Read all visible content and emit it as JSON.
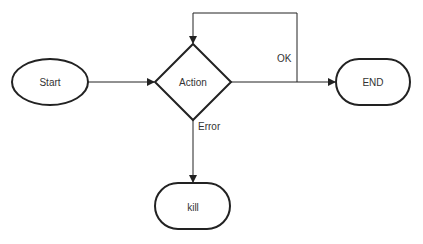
{
  "diagram": {
    "type": "flowchart",
    "nodes": [
      {
        "id": "start",
        "label": "Start",
        "shape": "ellipse"
      },
      {
        "id": "action",
        "label": "Action",
        "shape": "diamond"
      },
      {
        "id": "end",
        "label": "END",
        "shape": "rounded-rect"
      },
      {
        "id": "kill",
        "label": "kill",
        "shape": "rounded-rect"
      }
    ],
    "edges": [
      {
        "from": "start",
        "to": "action",
        "label": ""
      },
      {
        "from": "action",
        "to": "end",
        "label": "OK"
      },
      {
        "from": "action",
        "to": "action",
        "label": "",
        "kind": "loop-back"
      },
      {
        "from": "action",
        "to": "kill",
        "label": "Error"
      }
    ],
    "stroke_color": "#222222",
    "text_color": "#333333"
  }
}
